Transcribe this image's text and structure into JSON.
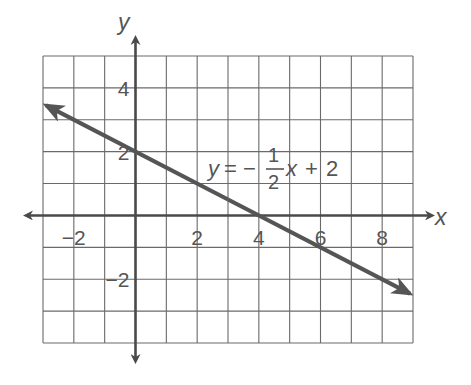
{
  "chart_data": {
    "type": "line",
    "title": "",
    "xlabel": "x",
    "ylabel": "y",
    "xlim": [
      -3,
      9
    ],
    "ylim": [
      -4,
      5
    ],
    "grid": true,
    "grid_step": 1,
    "x_ticks": [
      {
        "value": -2,
        "label": "−2"
      },
      {
        "value": 2,
        "label": "2"
      },
      {
        "value": 4,
        "label": "4"
      },
      {
        "value": 6,
        "label": "6"
      },
      {
        "value": 8,
        "label": "8"
      }
    ],
    "y_ticks": [
      {
        "value": 4,
        "label": "4"
      },
      {
        "value": 2,
        "label": "2"
      },
      {
        "value": -2,
        "label": "−2"
      }
    ],
    "series": [
      {
        "name": "y = -1/2 x + 2",
        "slope": -0.5,
        "intercept": 2,
        "x": [
          -2.9,
          8.9
        ],
        "y": [
          3.45,
          -2.45
        ],
        "arrows": "both"
      }
    ],
    "annotation": {
      "lhs": "y",
      "equals": "=",
      "sign": "−",
      "numerator": "1",
      "denominator": "2",
      "var": "x",
      "plus": "+",
      "constant": "2"
    },
    "colors": {
      "grid": "#6a6a6a",
      "axis": "#4a4a4a",
      "line": "#555555",
      "text": "#555555"
    }
  }
}
